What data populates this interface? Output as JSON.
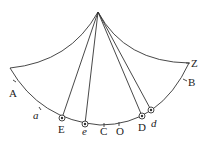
{
  "diagram": {
    "colors": {
      "stroke": "#333333",
      "background": "#ffffff"
    },
    "labels": {
      "A": "A",
      "B": "B",
      "Z": "Z",
      "a": "a",
      "E": "E",
      "e": "e",
      "C": "C",
      "O": "O",
      "D": "D",
      "d": "d"
    }
  }
}
